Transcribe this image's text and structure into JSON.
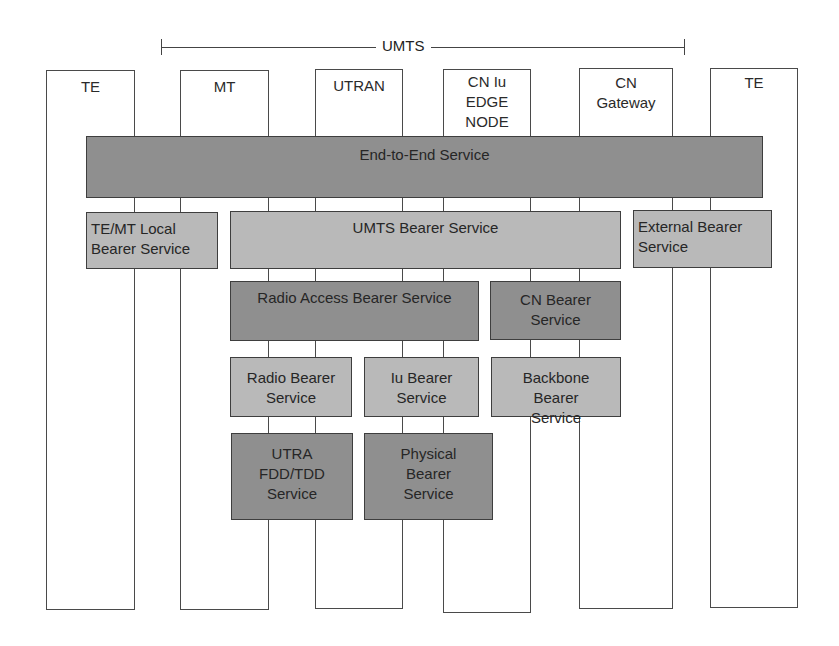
{
  "diagram": {
    "bracket": {
      "label": "UMTS"
    },
    "columns": [
      {
        "id": "te-left",
        "label": "TE"
      },
      {
        "id": "mt",
        "label": "MT"
      },
      {
        "id": "utran",
        "label": "UTRAN"
      },
      {
        "id": "cn-iu-edge-node",
        "label": "CN Iu\nEDGE\nNODE"
      },
      {
        "id": "cn-gateway",
        "label": "CN\nGateway"
      },
      {
        "id": "te-right",
        "label": "TE"
      }
    ],
    "services": {
      "end_to_end": "End-to-End Service",
      "te_mt_local": "TE/MT Local Bearer Service",
      "umts_bearer": "UMTS Bearer Service",
      "external_bearer": "External Bearer Service",
      "radio_access_bearer": "Radio Access Bearer Service",
      "cn_bearer": "CN Bearer Service",
      "radio_bearer": "Radio Bearer Service",
      "iu_bearer": "Iu Bearer Service",
      "backbone_bearer": "Backbone Bearer Service",
      "utra_fdd_tdd": "UTRA FDD/TDD Service",
      "physical_bearer": "Physical Bearer Service"
    },
    "colors": {
      "dark_box": "#8f8f8f",
      "light_box": "#b9b9b9",
      "border": "#3e3e3e",
      "background": "#ffffff"
    }
  }
}
